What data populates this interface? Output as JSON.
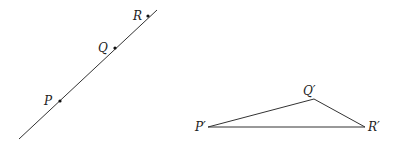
{
  "figure": {
    "left": {
      "kind": "collinear-points",
      "points": [
        {
          "id": "P",
          "label": "P"
        },
        {
          "id": "Q",
          "label": "Q"
        },
        {
          "id": "R",
          "label": "R"
        }
      ]
    },
    "right": {
      "kind": "triangle",
      "vertices": [
        {
          "id": "P1",
          "label": "P′"
        },
        {
          "id": "Q1",
          "label": "Q′"
        },
        {
          "id": "R1",
          "label": "R′"
        }
      ]
    }
  }
}
